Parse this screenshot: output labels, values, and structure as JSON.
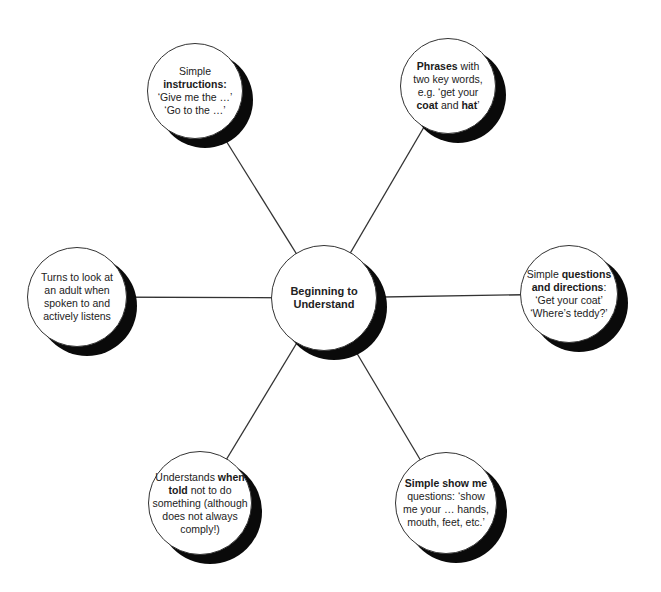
{
  "diagram": {
    "center": {
      "id": "center",
      "cx": 324,
      "cy": 298,
      "r": 53,
      "lines": [
        {
          "text": "Beginning to",
          "bold": true
        },
        {
          "text": "Understand",
          "bold": true
        }
      ]
    },
    "nodes": [
      {
        "id": "simple-instructions",
        "cx": 195,
        "cy": 91,
        "r": 48,
        "lines": [
          [
            {
              "text": "Simple",
              "bold": false
            }
          ],
          [
            {
              "text": "instructions:",
              "bold": true
            }
          ],
          [
            {
              "text": "‘Give me the …’",
              "bold": false
            }
          ],
          [
            {
              "text": "‘Go to the …’",
              "bold": false
            }
          ]
        ]
      },
      {
        "id": "phrases-two-key-words",
        "cx": 448,
        "cy": 86,
        "r": 48,
        "lines": [
          [
            {
              "text": "Phrases",
              "bold": true
            },
            {
              "text": " with",
              "bold": false
            }
          ],
          [
            {
              "text": "two key words,",
              "bold": false
            }
          ],
          [
            {
              "text": "e.g. ‘get your",
              "bold": false
            }
          ],
          [
            {
              "text": "coat",
              "bold": true
            },
            {
              "text": " and ",
              "bold": false
            },
            {
              "text": "hat",
              "bold": true
            },
            {
              "text": "’",
              "bold": false
            }
          ]
        ]
      },
      {
        "id": "turns-to-look",
        "cx": 77,
        "cy": 297,
        "r": 50,
        "lines": [
          [
            {
              "text": "Turns to look at",
              "bold": false
            }
          ],
          [
            {
              "text": "an adult when",
              "bold": false
            }
          ],
          [
            {
              "text": "spoken to and",
              "bold": false
            }
          ],
          [
            {
              "text": "actively listens",
              "bold": false
            }
          ]
        ]
      },
      {
        "id": "simple-questions-directions",
        "cx": 569,
        "cy": 294,
        "r": 49,
        "lines": [
          [
            {
              "text": "Simple ",
              "bold": false
            },
            {
              "text": "questions",
              "bold": true
            }
          ],
          [
            {
              "text": "and directions",
              "bold": true
            },
            {
              "text": ":",
              "bold": false
            }
          ],
          [
            {
              "text": "‘Get your coat’",
              "bold": false
            }
          ],
          [
            {
              "text": "‘Where’s teddy?’",
              "bold": false
            }
          ]
        ]
      },
      {
        "id": "understands-when-told",
        "cx": 200,
        "cy": 503,
        "r": 52,
        "lines": [
          [
            {
              "text": "Understands ",
              "bold": false
            },
            {
              "text": "when",
              "bold": true
            }
          ],
          [
            {
              "text": "told",
              "bold": true
            },
            {
              "text": " not to do",
              "bold": false
            }
          ],
          [
            {
              "text": "something (although",
              "bold": false
            }
          ],
          [
            {
              "text": "does not always",
              "bold": false
            }
          ],
          [
            {
              "text": "comply!)",
              "bold": false
            }
          ]
        ]
      },
      {
        "id": "simple-show-me",
        "cx": 446,
        "cy": 503,
        "r": 51,
        "lines": [
          [
            {
              "text": "Simple show me",
              "bold": true
            }
          ],
          [
            {
              "text": "questions: ‘show",
              "bold": false
            }
          ],
          [
            {
              "text": "me your … hands,",
              "bold": false
            }
          ],
          [
            {
              "text": "mouth, feet, etc.’",
              "bold": false
            }
          ]
        ]
      }
    ],
    "style": {
      "line_color": "#333333",
      "shadow_color": "#0a0a0a",
      "shadow_offset_x": 10,
      "shadow_offset_y": 9,
      "fill_color": "#ffffff"
    }
  }
}
